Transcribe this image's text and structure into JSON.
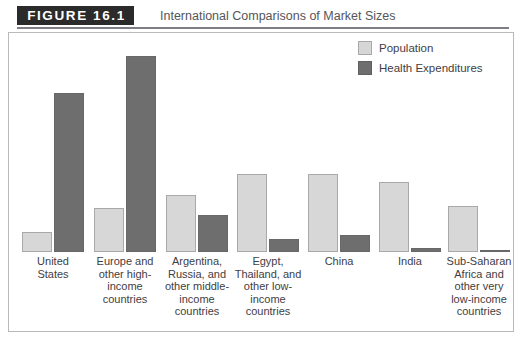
{
  "figure": {
    "tag": "FIGURE 16.1",
    "title": "International Comparisons of Market Sizes"
  },
  "legend": {
    "position": "top-right",
    "items": [
      {
        "label": "Population",
        "color": "#d6d6d6",
        "swatch": "population-swatch"
      },
      {
        "label": "Health Expenditures",
        "color": "#6e6e6e",
        "swatch": "health-expenditures-swatch"
      }
    ]
  },
  "chart_data": {
    "type": "bar",
    "title": "International Comparisons of Market Sizes",
    "xlabel": "",
    "ylabel": "",
    "grid": false,
    "legend_position": "top-right",
    "ylim": [
      0,
      100
    ],
    "axis_labeled": false,
    "categories": [
      "United States",
      "Europe and other high-income countries",
      "Argentina, Russia, and other middle-income countries",
      "Egypt, Thailand, and other low-income countries",
      "China",
      "India",
      "Sub-Saharan Africa and other very low-income countries"
    ],
    "category_lines": [
      [
        "United",
        "States"
      ],
      [
        "Europe and",
        "other high-",
        "income",
        "countries"
      ],
      [
        "Argentina,",
        "Russia, and",
        "other middle-",
        "income",
        "countries"
      ],
      [
        "Egypt,",
        "Thailand, and",
        "other low-",
        "income",
        "countries"
      ],
      [
        "China"
      ],
      [
        "India"
      ],
      [
        "Sub-Saharan",
        "Africa and",
        "other very",
        "low-income",
        "countries"
      ]
    ],
    "series": [
      {
        "name": "Population",
        "color": "#d6d6d6",
        "values": [
          9,
          20,
          26,
          36,
          36,
          32,
          21
        ]
      },
      {
        "name": "Health Expenditures",
        "color": "#6e6e6e",
        "values": [
          73,
          90,
          17,
          6,
          8,
          2,
          1
        ]
      }
    ]
  },
  "layout": {
    "bar_width": 30,
    "group_centers": [
      44,
      116,
      188,
      259,
      330,
      401,
      470
    ],
    "plot_height_px": 219,
    "value_scale_px_per_unit": 2.18
  }
}
